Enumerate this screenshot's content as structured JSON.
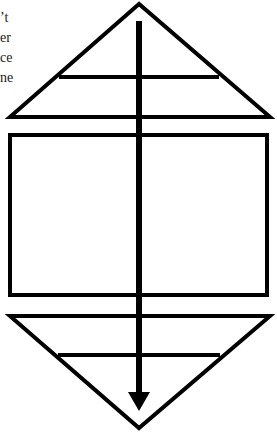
{
  "text_fragments": {
    "lines": [
      "’t",
      "er",
      "ce",
      "ne"
    ]
  },
  "diagram": {
    "stroke_color": "#000000",
    "background_color": "#ffffff",
    "shapes": {
      "top_triangle": {
        "apex": [
          139,
          3
        ],
        "base_left": [
          10,
          117
        ],
        "base_right": [
          270,
          117
        ],
        "inner_line_y": 77
      },
      "middle_rectangle": {
        "x": 9,
        "y": 134,
        "width": 259,
        "height": 162
      },
      "bottom_triangle": {
        "top_left": [
          10,
          316
        ],
        "top_right": [
          270,
          316
        ],
        "apex": [
          139,
          428
        ],
        "inner_line_y": 355
      },
      "arrow": {
        "x": 139,
        "y_start": 21,
        "y_end": 410,
        "direction": "down"
      }
    }
  }
}
